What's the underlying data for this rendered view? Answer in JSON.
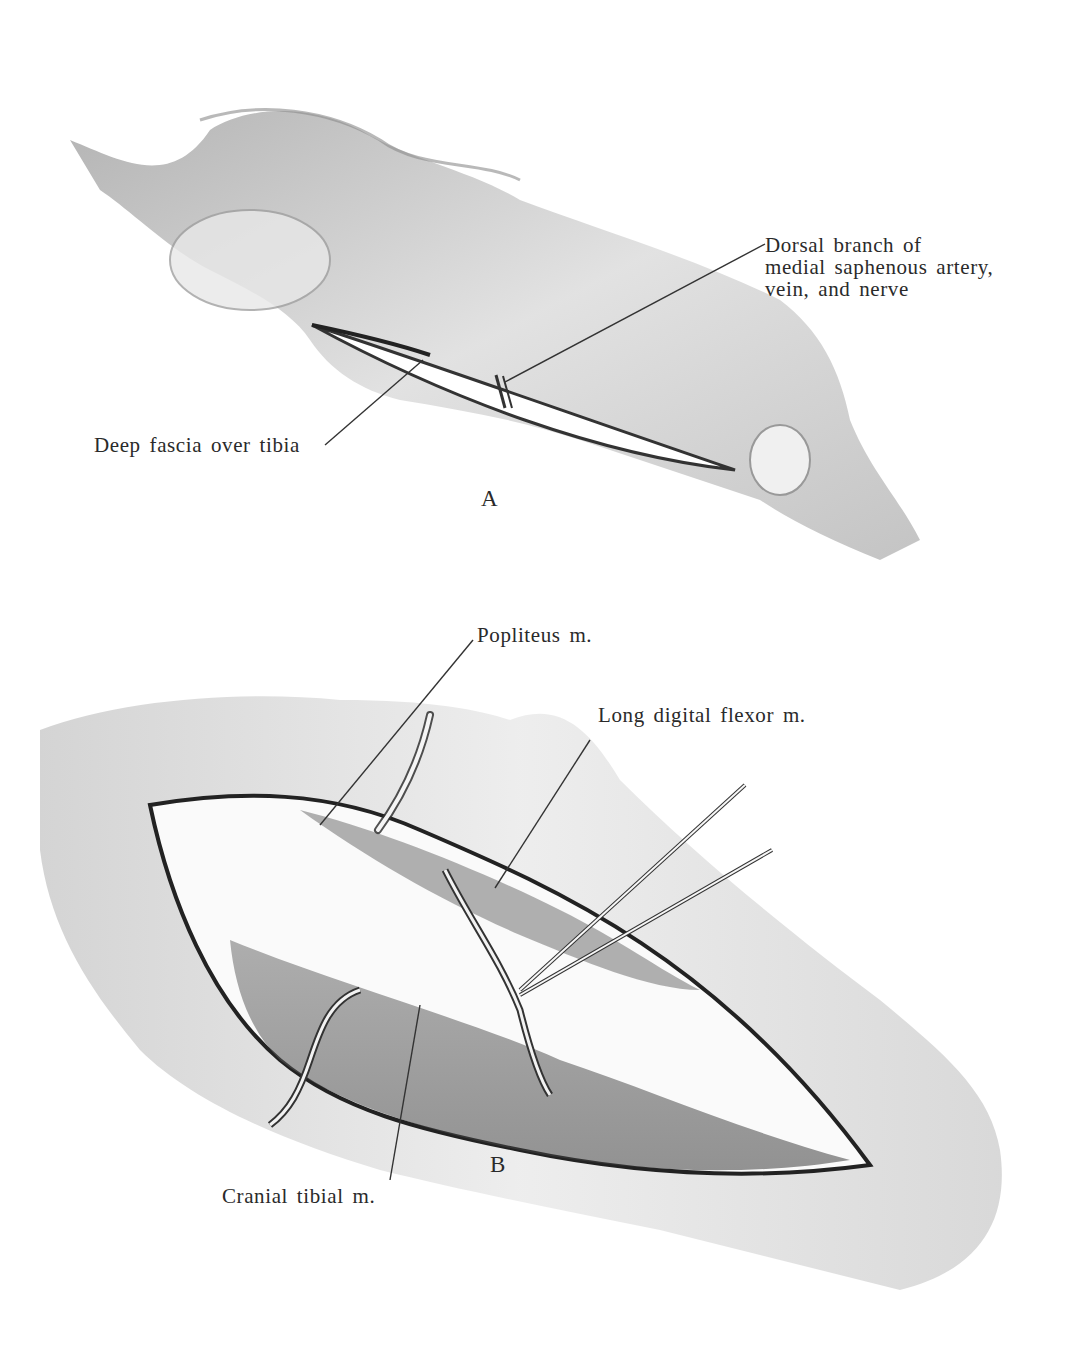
{
  "figure": {
    "panels": [
      {
        "id": "A",
        "letter": "A",
        "labels": {
          "dorsal_branch": [
            "Dorsal branch of",
            "medial saphenous artery,",
            "vein, and nerve"
          ],
          "deep_fascia": "Deep fascia over tibia"
        }
      },
      {
        "id": "B",
        "letter": "B",
        "labels": {
          "popliteus": "Popliteus m.",
          "long_digital_flexor": "Long digital flexor m.",
          "cranial_tibial": "Cranial tibial m."
        }
      }
    ],
    "colors": {
      "ink": "#2a2a2a",
      "shade": "#8a8a8a",
      "light_shade": "#c8c8c8",
      "paper": "#ffffff"
    }
  }
}
